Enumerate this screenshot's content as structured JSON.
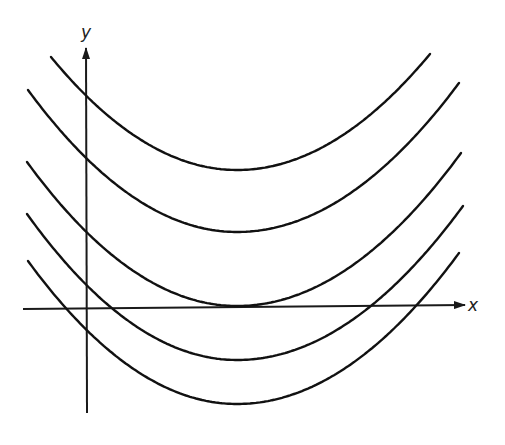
{
  "figure": {
    "axes": {
      "x_label": "x",
      "y_label": "y",
      "color": "#1a1a1a"
    },
    "curves": [
      {
        "name": "parabola-1",
        "left": [
          51,
          57
        ],
        "vertex": [
          237,
          170
        ],
        "right": [
          430,
          54
        ]
      },
      {
        "name": "parabola-2",
        "left": [
          28,
          90
        ],
        "vertex": [
          237,
          232
        ],
        "right": [
          459,
          83
        ]
      },
      {
        "name": "parabola-3",
        "left": [
          27,
          162
        ],
        "vertex": [
          237,
          306
        ],
        "right": [
          461,
          153
        ],
        "note": "tangent to x-axis"
      },
      {
        "name": "parabola-4",
        "left": [
          27,
          214
        ],
        "vertex": [
          237,
          360
        ],
        "right": [
          463,
          206
        ]
      },
      {
        "name": "parabola-5",
        "left": [
          28,
          261
        ],
        "vertex": [
          237,
          404
        ],
        "right": [
          459,
          253
        ]
      }
    ],
    "stroke_color": "#111111"
  }
}
